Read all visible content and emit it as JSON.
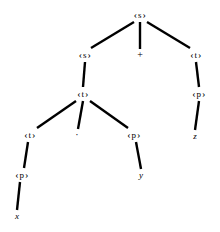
{
  "figure": {
    "kind": "parse-tree",
    "caption": "",
    "width": 220,
    "height": 232,
    "background_color": "#ffffff",
    "edge_color": "#000000",
    "text_color": "#000000"
  },
  "nodes": [
    {
      "id": "n0",
      "label": "<s>",
      "symbol": "s",
      "type": "nonterminal",
      "x": 140,
      "y": 15
    },
    {
      "id": "n1",
      "label": "<s>",
      "symbol": "s",
      "type": "nonterminal",
      "x": 85,
      "y": 55
    },
    {
      "id": "n2",
      "label": "+",
      "symbol": "+",
      "type": "operator",
      "x": 140,
      "y": 55
    },
    {
      "id": "n3",
      "label": "<t>",
      "symbol": "t",
      "type": "nonterminal",
      "x": 196,
      "y": 55
    },
    {
      "id": "n4",
      "label": "<t>",
      "symbol": "t",
      "type": "nonterminal",
      "x": 83,
      "y": 94
    },
    {
      "id": "n5",
      "label": "<p>",
      "symbol": "p",
      "type": "nonterminal",
      "x": 199,
      "y": 94
    },
    {
      "id": "n6",
      "label": "<t>",
      "symbol": "t",
      "type": "nonterminal",
      "x": 30,
      "y": 135
    },
    {
      "id": "n7",
      "label": "·",
      "symbol": "·",
      "type": "operator",
      "x": 77,
      "y": 135
    },
    {
      "id": "n8",
      "label": "<p>",
      "symbol": "p",
      "type": "nonterminal",
      "x": 134,
      "y": 135
    },
    {
      "id": "n9",
      "label": "z",
      "symbol": "z",
      "type": "terminal",
      "x": 195,
      "y": 136
    },
    {
      "id": "n10",
      "label": "<p>",
      "symbol": "p",
      "type": "nonterminal",
      "x": 22,
      "y": 175
    },
    {
      "id": "n11",
      "label": "y",
      "symbol": "y",
      "type": "terminal",
      "x": 141,
      "y": 175
    },
    {
      "id": "n12",
      "label": "x",
      "symbol": "x",
      "type": "terminal",
      "x": 17,
      "y": 216
    }
  ],
  "edges": [
    {
      "from": "n0",
      "to": "n1",
      "x1": 134,
      "y1": 22,
      "x2": 91,
      "y2": 48
    },
    {
      "from": "n0",
      "to": "n2",
      "x1": 140,
      "y1": 22,
      "x2": 140,
      "y2": 49
    },
    {
      "from": "n0",
      "to": "n3",
      "x1": 147,
      "y1": 22,
      "x2": 190,
      "y2": 48
    },
    {
      "from": "n1",
      "to": "n4",
      "x1": 85,
      "y1": 62,
      "x2": 83,
      "y2": 87
    },
    {
      "from": "n3",
      "to": "n5",
      "x1": 196,
      "y1": 62,
      "x2": 199,
      "y2": 87
    },
    {
      "from": "n4",
      "to": "n6",
      "x1": 76,
      "y1": 101,
      "x2": 37,
      "y2": 128
    },
    {
      "from": "n4",
      "to": "n7",
      "x1": 83,
      "y1": 101,
      "x2": 78,
      "y2": 129
    },
    {
      "from": "n4",
      "to": "n8",
      "x1": 90,
      "y1": 101,
      "x2": 128,
      "y2": 128
    },
    {
      "from": "n5",
      "to": "n9",
      "x1": 199,
      "y1": 101,
      "x2": 195,
      "y2": 130
    },
    {
      "from": "n6",
      "to": "n10",
      "x1": 28,
      "y1": 142,
      "x2": 24,
      "y2": 168
    },
    {
      "from": "n8",
      "to": "n11",
      "x1": 136,
      "y1": 142,
      "x2": 141,
      "y2": 169
    },
    {
      "from": "n10",
      "to": "n12",
      "x1": 20,
      "y1": 182,
      "x2": 17,
      "y2": 210
    }
  ],
  "style": {
    "edge_width": 2.4,
    "left_chevron": "‹",
    "right_chevron": "›"
  }
}
